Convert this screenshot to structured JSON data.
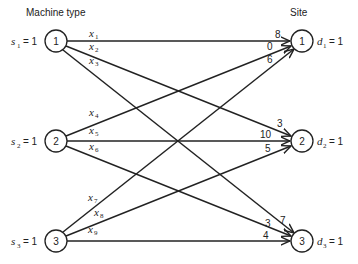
{
  "headers": {
    "left": "Machine type",
    "right": "Site"
  },
  "sources": [
    {
      "id": "1",
      "label_var": "s",
      "label_sub": "1",
      "label_eq": "= 1"
    },
    {
      "id": "2",
      "label_var": "s",
      "label_sub": "2",
      "label_eq": "= 1"
    },
    {
      "id": "3",
      "label_var": "s",
      "label_sub": "3",
      "label_eq": "= 1"
    }
  ],
  "sinks": [
    {
      "id": "1",
      "label_var": "d",
      "label_sub": "1",
      "label_eq": "= 1"
    },
    {
      "id": "2",
      "label_var": "d",
      "label_sub": "2",
      "label_eq": "= 1"
    },
    {
      "id": "3",
      "label_var": "d",
      "label_sub": "3",
      "label_eq": "= 1"
    }
  ],
  "edges": [
    {
      "var": "x",
      "sub": "1",
      "from": "1",
      "to": "1",
      "cost": "8"
    },
    {
      "var": "x",
      "sub": "2",
      "from": "1",
      "to": "2",
      "cost": "3"
    },
    {
      "var": "x",
      "sub": "3",
      "from": "1",
      "to": "3",
      "cost": "7"
    },
    {
      "var": "x",
      "sub": "4",
      "from": "2",
      "to": "1",
      "cost": "0"
    },
    {
      "var": "x",
      "sub": "5",
      "from": "2",
      "to": "2",
      "cost": "10"
    },
    {
      "var": "x",
      "sub": "6",
      "from": "2",
      "to": "3",
      "cost": "3"
    },
    {
      "var": "x",
      "sub": "7",
      "from": "3",
      "to": "1",
      "cost": "6"
    },
    {
      "var": "x",
      "sub": "8",
      "from": "3",
      "to": "2",
      "cost": "5"
    },
    {
      "var": "x",
      "sub": "9",
      "from": "3",
      "to": "3",
      "cost": "4"
    }
  ]
}
